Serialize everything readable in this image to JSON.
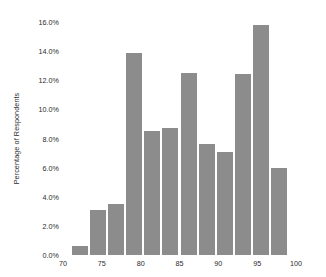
{
  "chart_data": {
    "type": "bar",
    "title": "",
    "subtitle": "",
    "xlabel": "",
    "ylabel": "Percentage of Respondents",
    "xlim": [
      70,
      100
    ],
    "ylim": [
      0,
      16
    ],
    "grid": false,
    "legend": null,
    "bar_color": "#8c8c8c",
    "background_color": "#ffffff",
    "text_color": "#2b2b2b",
    "xtick_labels": [
      "70",
      "75",
      "80",
      "85",
      "90",
      "95",
      "100"
    ],
    "xtick_values": [
      70,
      75,
      80,
      85,
      90,
      95,
      100
    ],
    "ytick_labels": [
      "0.0%",
      "2.0%",
      "4.0%",
      "6.0%",
      "8.0%",
      "10.0%",
      "12.0%",
      "14.0%",
      "16.0%"
    ],
    "ytick_values": [
      0,
      2,
      4,
      6,
      8,
      10,
      12,
      14,
      16
    ],
    "bin_edges": [
      71.0,
      73.33,
      75.67,
      78.0,
      80.33,
      82.67,
      85.0,
      87.33,
      89.67,
      92.0,
      94.33,
      96.67,
      99.0
    ],
    "categories": [
      "71.0-73.3",
      "73.3-75.7",
      "75.7-78.0",
      "78.0-80.3",
      "80.3-82.7",
      "82.7-85.0",
      "85.0-87.3",
      "87.3-89.7",
      "89.7-92.0",
      "92.0-94.3",
      "94.3-96.7",
      "96.7-99.0"
    ],
    "values": [
      0.6,
      3.1,
      3.5,
      13.9,
      8.5,
      8.7,
      12.5,
      7.6,
      7.1,
      12.4,
      15.8,
      6.0
    ]
  }
}
